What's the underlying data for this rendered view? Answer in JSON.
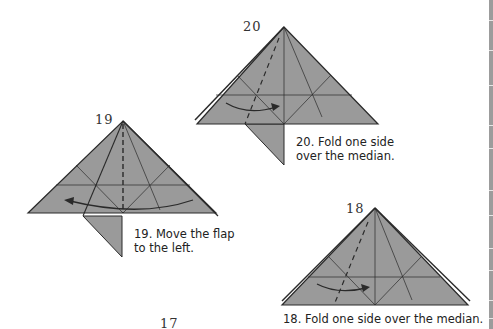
{
  "page": {
    "colors": {
      "paper_fill": "#9a9a9a",
      "line": "#2a2a2a",
      "background": "#ffffff"
    }
  },
  "steps": [
    {
      "number": "20",
      "caption_line1": "20. Fold one side",
      "caption_line2": "over the median."
    },
    {
      "number": "19",
      "caption_line1": "19. Move the flap",
      "caption_line2": "to the left."
    },
    {
      "number": "18",
      "caption_line1": "18. Fold one side over the median.",
      "caption_line2": ""
    },
    {
      "number": "17"
    }
  ]
}
